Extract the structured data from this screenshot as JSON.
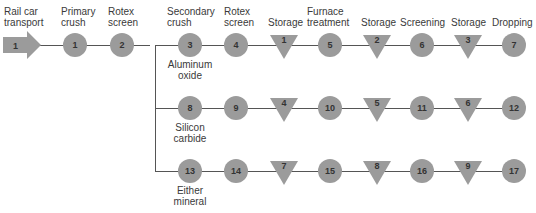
{
  "headers": [
    {
      "text": "Rail car\ntransport",
      "x": 4
    },
    {
      "text": "Primary\ncrush",
      "x": 61
    },
    {
      "text": "Rotex\nscreen",
      "x": 108
    },
    {
      "text": "Secondary\ncrush",
      "x": 167
    },
    {
      "text": "Rotex\nscreen",
      "x": 224
    },
    {
      "text": "Storage",
      "x": 268
    },
    {
      "text": "Furnace\ntreatment",
      "x": 307
    },
    {
      "text": "Storage",
      "x": 361
    },
    {
      "text": "Screening",
      "x": 400
    },
    {
      "text": "Storage",
      "x": 451
    },
    {
      "text": "Dropping",
      "x": 492
    }
  ],
  "start_arrow": {
    "label": "1"
  },
  "common": [
    {
      "type": "operation",
      "label": "1",
      "x": 75
    },
    {
      "type": "operation",
      "label": "2",
      "x": 122
    }
  ],
  "branches": [
    {
      "name": "Aluminum\noxide",
      "y": 45,
      "items": [
        {
          "type": "operation",
          "label": "3"
        },
        {
          "type": "operation",
          "label": "4"
        },
        {
          "type": "storage",
          "label": "1"
        },
        {
          "type": "operation",
          "label": "5"
        },
        {
          "type": "storage",
          "label": "2"
        },
        {
          "type": "operation",
          "label": "6"
        },
        {
          "type": "storage",
          "label": "3"
        },
        {
          "type": "operation",
          "label": "7"
        }
      ]
    },
    {
      "name": "Silicon\ncarbide",
      "y": 108,
      "items": [
        {
          "type": "operation",
          "label": "8"
        },
        {
          "type": "operation",
          "label": "9"
        },
        {
          "type": "storage",
          "label": "4"
        },
        {
          "type": "operation",
          "label": "10"
        },
        {
          "type": "storage",
          "label": "5"
        },
        {
          "type": "operation",
          "label": "11"
        },
        {
          "type": "storage",
          "label": "6"
        },
        {
          "type": "operation",
          "label": "12"
        }
      ]
    },
    {
      "name": "Either\nmineral",
      "y": 171,
      "items": [
        {
          "type": "operation",
          "label": "13"
        },
        {
          "type": "operation",
          "label": "14"
        },
        {
          "type": "storage",
          "label": "7"
        },
        {
          "type": "operation",
          "label": "15"
        },
        {
          "type": "storage",
          "label": "8"
        },
        {
          "type": "operation",
          "label": "16"
        },
        {
          "type": "storage",
          "label": "9"
        },
        {
          "type": "operation",
          "label": "17"
        }
      ]
    }
  ],
  "colors": {
    "shape": "#9b9b9b",
    "line": "#555555"
  }
}
